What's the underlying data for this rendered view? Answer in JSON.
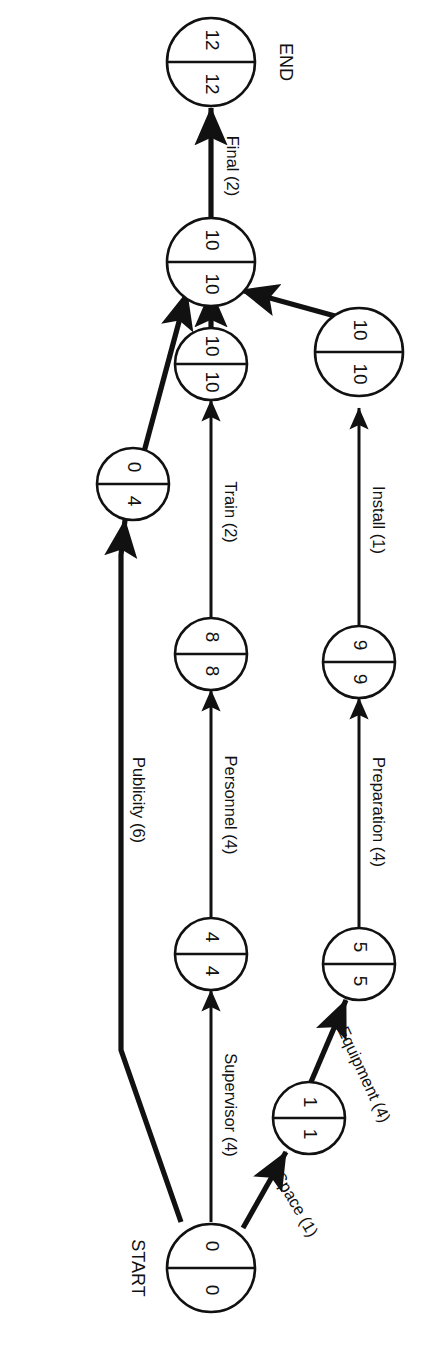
{
  "diagram": {
    "type": "cpm-network",
    "title_labels": {
      "start": "START",
      "end": "END"
    },
    "node_value_format": "earliest | latest",
    "nodes": [
      {
        "id": "start",
        "left": "0",
        "right": "0",
        "caption": "START"
      },
      {
        "id": "space",
        "left": "1",
        "right": "1",
        "caption": ""
      },
      {
        "id": "equipment",
        "left": "5",
        "right": "5",
        "caption": ""
      },
      {
        "id": "prep",
        "left": "9",
        "right": "9",
        "caption": ""
      },
      {
        "id": "install",
        "left": "10",
        "right": "10",
        "caption": ""
      },
      {
        "id": "supervisor",
        "left": "4",
        "right": "4",
        "caption": ""
      },
      {
        "id": "personnel",
        "left": "8",
        "right": "8",
        "caption": ""
      },
      {
        "id": "train",
        "left": "10",
        "right": "10",
        "caption": ""
      },
      {
        "id": "publicity",
        "left": "0",
        "right": "4",
        "caption": ""
      },
      {
        "id": "merge",
        "left": "10",
        "right": "10",
        "caption": ""
      },
      {
        "id": "end",
        "left": "12",
        "right": "12",
        "caption": "END"
      }
    ],
    "edges": [
      {
        "id": "space",
        "label": "Space (1)",
        "duration": 1,
        "from": "start",
        "to": "space",
        "critical": true
      },
      {
        "id": "equipment",
        "label": "Equipment (4)",
        "duration": 4,
        "from": "space",
        "to": "equipment",
        "critical": true
      },
      {
        "id": "preparation",
        "label": "Preparation (4)",
        "duration": 4,
        "from": "equipment",
        "to": "prep",
        "critical": false
      },
      {
        "id": "install",
        "label": "Install (1)",
        "duration": 1,
        "from": "prep",
        "to": "install",
        "critical": false
      },
      {
        "id": "install-merge",
        "label": "",
        "duration": 0,
        "from": "install",
        "to": "merge",
        "critical": true
      },
      {
        "id": "supervisor",
        "label": "Supervisor (4)",
        "duration": 4,
        "from": "start",
        "to": "supervisor",
        "critical": false
      },
      {
        "id": "personnel",
        "label": "Personnel (4)",
        "duration": 4,
        "from": "supervisor",
        "to": "personnel",
        "critical": false
      },
      {
        "id": "train",
        "label": "Train (2)",
        "duration": 2,
        "from": "personnel",
        "to": "train",
        "critical": false
      },
      {
        "id": "train-merge",
        "label": "",
        "duration": 0,
        "from": "train",
        "to": "merge",
        "critical": false
      },
      {
        "id": "publicity",
        "label": "Publicity (6)",
        "duration": 6,
        "from": "start",
        "to": "publicity",
        "critical": false
      },
      {
        "id": "publicity-merge",
        "label": "",
        "duration": 0,
        "from": "publicity",
        "to": "merge",
        "critical": true
      },
      {
        "id": "final",
        "label": "Final (2)",
        "duration": 2,
        "from": "merge",
        "to": "end",
        "critical": false
      }
    ]
  }
}
